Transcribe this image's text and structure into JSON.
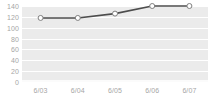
{
  "chart_data": {
    "type": "line",
    "title": "",
    "subtitle": "",
    "xlabel": "",
    "ylabel": "",
    "categories": [
      "6/03",
      "6/04",
      "6/05",
      "6/06",
      "6/07"
    ],
    "series": [
      {
        "name": "series-1",
        "values": [
          118,
          118,
          126,
          140,
          140
        ]
      }
    ],
    "ylim": [
      0,
      140
    ],
    "yticks": [
      0,
      20,
      40,
      60,
      80,
      100,
      120,
      140
    ],
    "ytick_labels": [
      "0",
      "20",
      "40",
      "60",
      "80",
      "100",
      "120",
      "140"
    ],
    "grid": true,
    "grid_axis": "y",
    "legend": false,
    "legend_position": "none",
    "colors": {
      "plot_background": "#ebebeb",
      "gridline": "#ffffff",
      "line": "#4d4d4d",
      "marker_fill": "#ffffff",
      "marker_stroke": "#808080",
      "tick_label": "#a6a6a6",
      "page_background": "#ffffff"
    },
    "marker": "circle",
    "line_width": 1.6,
    "marker_size": 4
  }
}
